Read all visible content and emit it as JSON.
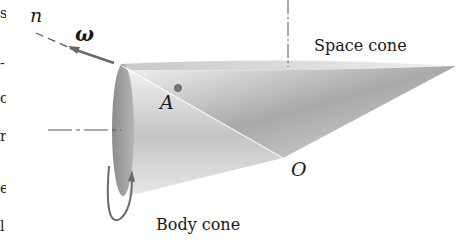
{
  "diagram": {
    "labels": {
      "axis_n": "n",
      "omega": "ω",
      "point_A": "A",
      "point_O": "O",
      "space_cone": "Space cone",
      "body_cone": "Body cone"
    },
    "colors": {
      "background": "#ffffff",
      "line": "#555555",
      "text": "#1a1a1a",
      "cone_dark": "#8a8a8a",
      "cone_light": "#e6e6e6"
    },
    "left_margin_text_fragments": [
      "s",
      "-",
      "o",
      "r",
      "e",
      "l"
    ]
  }
}
